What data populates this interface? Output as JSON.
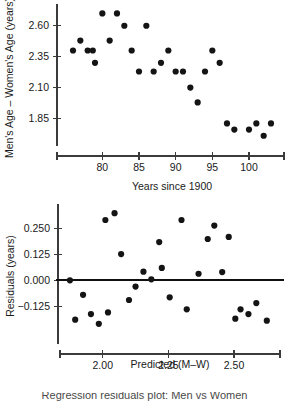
{
  "figure": {
    "background": "#ffffff",
    "point_color": "#141414",
    "axis_color": "#3b3b3b",
    "zero_line_color": "#101010"
  },
  "caption": {
    "text": "Regression residuals plot: Men vs Women"
  },
  "chart_data": [
    {
      "type": "scatter",
      "id": "age-gap-vs-year",
      "title": "",
      "xlabel": "Years since 1900",
      "ylabel": "Men's Age – Women's Age (years)",
      "xlim": [
        74.5,
        104.5
      ],
      "ylim": [
        1.7,
        2.76
      ],
      "xticks": [
        80,
        85,
        90,
        95,
        100
      ],
      "xticklabels": [
        "80",
        "85",
        "90",
        "95",
        "100"
      ],
      "yticks": [
        2.6,
        2.35,
        2.1,
        1.85
      ],
      "yticklabels": [
        "2.60",
        "2.35",
        "2.10",
        "1.85"
      ],
      "grid": false,
      "legend": false,
      "points": [
        {
          "x": 76,
          "y": 2.4
        },
        {
          "x": 77,
          "y": 2.48
        },
        {
          "x": 78,
          "y": 2.4
        },
        {
          "x": 78.7,
          "y": 2.4
        },
        {
          "x": 79,
          "y": 2.3
        },
        {
          "x": 80,
          "y": 2.7
        },
        {
          "x": 81,
          "y": 2.48
        },
        {
          "x": 82,
          "y": 2.7
        },
        {
          "x": 83,
          "y": 2.6
        },
        {
          "x": 84,
          "y": 2.4
        },
        {
          "x": 85,
          "y": 2.23
        },
        {
          "x": 86,
          "y": 2.6
        },
        {
          "x": 87,
          "y": 2.23
        },
        {
          "x": 88,
          "y": 2.3
        },
        {
          "x": 89,
          "y": 2.4
        },
        {
          "x": 90,
          "y": 2.23
        },
        {
          "x": 91,
          "y": 2.23
        },
        {
          "x": 92,
          "y": 2.1
        },
        {
          "x": 93,
          "y": 1.98
        },
        {
          "x": 94,
          "y": 2.23
        },
        {
          "x": 95,
          "y": 2.4
        },
        {
          "x": 96,
          "y": 2.3
        },
        {
          "x": 97,
          "y": 1.81
        },
        {
          "x": 98,
          "y": 1.76
        },
        {
          "x": 100,
          "y": 1.76
        },
        {
          "x": 101,
          "y": 1.81
        },
        {
          "x": 102,
          "y": 1.71
        },
        {
          "x": 103,
          "y": 1.81
        }
      ]
    },
    {
      "type": "scatter",
      "id": "residuals-vs-predicted",
      "title": "",
      "xlabel": "Predicted (M–W)",
      "ylabel": "Residuals (years)",
      "xlim": [
        1.86,
        2.66
      ],
      "ylim": [
        -0.24,
        0.35
      ],
      "xticks": [
        2.0,
        2.25,
        2.5
      ],
      "xticklabels": [
        "2.00",
        "2.25",
        "2.50"
      ],
      "yticks": [
        0.25,
        0.125,
        0.0,
        -0.125
      ],
      "yticklabels": [
        "0.250",
        "0.125",
        "0.000",
        "−0.125"
      ],
      "grid": false,
      "legend": false,
      "reference_line": {
        "y": 0.0
      },
      "points": [
        {
          "x": 1.875,
          "y": 0.0
        },
        {
          "x": 1.895,
          "y": -0.19
        },
        {
          "x": 1.925,
          "y": -0.07
        },
        {
          "x": 1.955,
          "y": -0.163
        },
        {
          "x": 1.985,
          "y": -0.21
        },
        {
          "x": 2.01,
          "y": 0.292
        },
        {
          "x": 2.02,
          "y": -0.155
        },
        {
          "x": 2.045,
          "y": 0.325
        },
        {
          "x": 2.07,
          "y": 0.127
        },
        {
          "x": 2.1,
          "y": -0.095
        },
        {
          "x": 2.125,
          "y": -0.03
        },
        {
          "x": 2.155,
          "y": 0.042
        },
        {
          "x": 2.185,
          "y": 0.005
        },
        {
          "x": 2.215,
          "y": 0.185
        },
        {
          "x": 2.225,
          "y": 0.06
        },
        {
          "x": 2.255,
          "y": -0.082
        },
        {
          "x": 2.3,
          "y": 0.292
        },
        {
          "x": 2.32,
          "y": -0.14
        },
        {
          "x": 2.365,
          "y": 0.032
        },
        {
          "x": 2.4,
          "y": 0.2
        },
        {
          "x": 2.425,
          "y": 0.265
        },
        {
          "x": 2.455,
          "y": 0.04
        },
        {
          "x": 2.48,
          "y": 0.21
        },
        {
          "x": 2.505,
          "y": -0.185
        },
        {
          "x": 2.525,
          "y": -0.14
        },
        {
          "x": 2.555,
          "y": -0.163
        },
        {
          "x": 2.585,
          "y": -0.11
        },
        {
          "x": 2.625,
          "y": -0.195
        }
      ]
    }
  ]
}
